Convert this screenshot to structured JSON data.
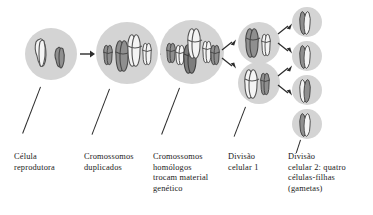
{
  "diagram": {
    "language": "pt-BR",
    "background_color": "#ffffff",
    "cell_fill_color": "#d4d4d4",
    "chromosome_dark_color": "#8a8a8a",
    "chromosome_light_color": "#f2f2f2",
    "chromosome_outline_color": "#4a4a4a",
    "arrow_color": "#2b2b2b",
    "leader_line_color": "#2b2b2b"
  },
  "stages": [
    {
      "id": "stage-1",
      "label": "Célula\nreprodutora",
      "cell_count": 1,
      "chromosomes_per_cell": 2,
      "duplicated": false,
      "description": "reproductive cell with two unduplicated chromosomes"
    },
    {
      "id": "stage-2",
      "label": "Cromossomos\nduplicados",
      "cell_count": 1,
      "chromosomes_per_cell": 4,
      "duplicated": true,
      "description": "duplicated chromosomes, sister chromatids paired"
    },
    {
      "id": "stage-3",
      "label": "Cromossomos\nhomólogos\ntrocam material\ngenético",
      "cell_count": 1,
      "chromosomes_per_cell": 4,
      "duplicated": true,
      "description": "homologous chromosomes exchange genetic material (crossing over)"
    },
    {
      "id": "stage-4",
      "label": "Divisão\ncelular 1",
      "cell_count": 2,
      "chromosomes_per_cell": 2,
      "duplicated": true,
      "description": "first cell division produces two cells"
    },
    {
      "id": "stage-5",
      "label": "Divisão\ncelular 2: quatro\ncélulas-filhas\n(gametas)",
      "cell_count": 4,
      "chromosomes_per_cell": 2,
      "duplicated": false,
      "description": "second cell division produces four daughter cells (gametes)"
    }
  ],
  "arrows": [
    {
      "id": "arrow-1-2",
      "from": "stage-1",
      "to": "stage-2",
      "kind": "straight"
    },
    {
      "id": "arrow-2-3",
      "from": "stage-2",
      "to": "stage-3",
      "kind": "straight"
    },
    {
      "id": "arrow-3-4a",
      "from": "stage-3",
      "to": "stage-4-cell-a",
      "kind": "branch-up"
    },
    {
      "id": "arrow-3-4b",
      "from": "stage-3",
      "to": "stage-4-cell-b",
      "kind": "branch-down"
    },
    {
      "id": "arrow-4a-5a",
      "from": "stage-4-cell-a",
      "to": "stage-5-cell-1",
      "kind": "branch-up"
    },
    {
      "id": "arrow-4a-5b",
      "from": "stage-4-cell-a",
      "to": "stage-5-cell-2",
      "kind": "branch-down"
    },
    {
      "id": "arrow-4b-5c",
      "from": "stage-4-cell-b",
      "to": "stage-5-cell-3",
      "kind": "branch-up"
    },
    {
      "id": "arrow-4b-5d",
      "from": "stage-4-cell-b",
      "to": "stage-5-cell-4",
      "kind": "branch-down"
    }
  ]
}
